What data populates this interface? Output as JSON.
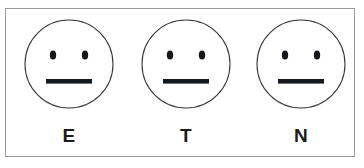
{
  "figure": {
    "background_color": "#ffffff",
    "frame_border_color": "#9a9a9a",
    "ink_color": "#1c1c1c",
    "face_outline_color": "#3a3a3a",
    "faces": [
      {
        "label": "E",
        "expression": "neutral-face",
        "eyes": "two-oval-eyes",
        "mouth": "straight-horizontal-bar"
      },
      {
        "label": "T",
        "expression": "neutral-face",
        "eyes": "two-oval-eyes",
        "mouth": "straight-horizontal-bar"
      },
      {
        "label": "N",
        "expression": "neutral-face",
        "eyes": "two-oval-eyes",
        "mouth": "straight-horizontal-bar"
      }
    ]
  }
}
